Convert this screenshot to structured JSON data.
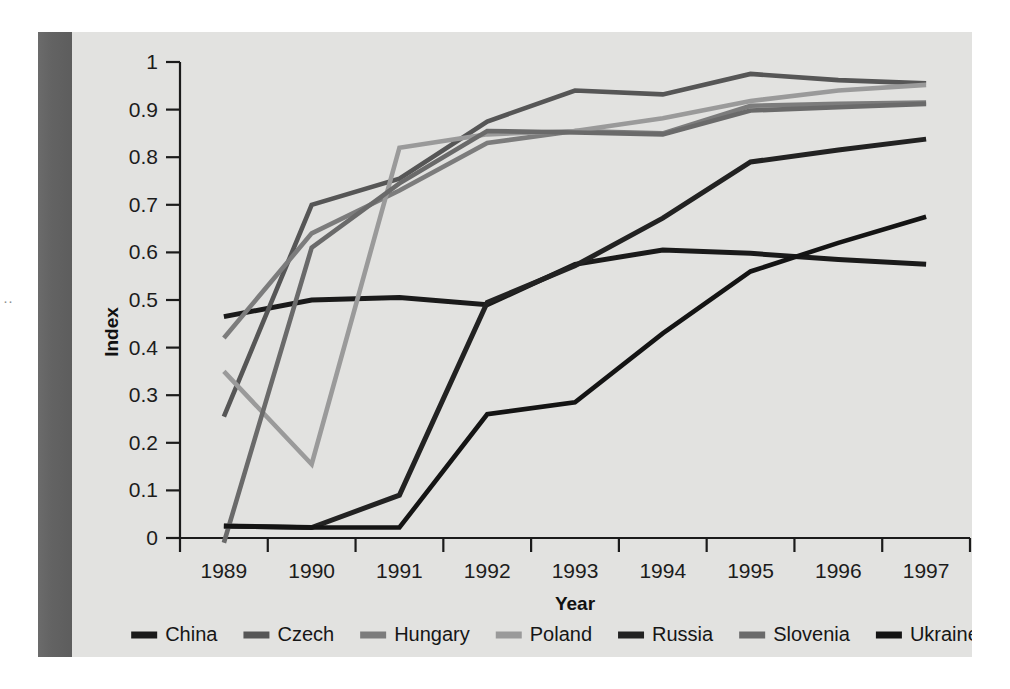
{
  "page": {
    "background_color": "#e2e2e0",
    "gutter_color": "#636363",
    "margin_mark": "··"
  },
  "chart_data": {
    "type": "line",
    "title": "",
    "xlabel": "Year",
    "ylabel": "Index",
    "categories": [
      "1989",
      "1990",
      "1991",
      "1992",
      "1993",
      "1994",
      "1995",
      "1996",
      "1997"
    ],
    "x": [
      1989,
      1990,
      1991,
      1992,
      1993,
      1994,
      1995,
      1996,
      1997
    ],
    "xlim": [
      1989,
      1997
    ],
    "ylim": [
      0,
      1
    ],
    "yticks": [
      "0",
      "0.1",
      "0.2",
      "0.3",
      "0.4",
      "0.5",
      "0.6",
      "0.7",
      "0.8",
      "0.9",
      "1"
    ],
    "ytick_values": [
      0,
      0.1,
      0.2,
      0.3,
      0.4,
      0.5,
      0.6,
      0.7,
      0.8,
      0.9,
      1
    ],
    "grid": false,
    "legend_position": "bottom",
    "series": [
      {
        "name": "China",
        "color": "#1a1a1a",
        "width": 5.0,
        "values": [
          0.465,
          0.5,
          0.505,
          0.49,
          0.575,
          0.605,
          0.598,
          0.585,
          0.575
        ]
      },
      {
        "name": "Czech",
        "color": "#565656",
        "width": 4.6,
        "values": [
          0.255,
          0.7,
          0.755,
          0.875,
          0.94,
          0.932,
          0.975,
          0.962,
          0.955
        ]
      },
      {
        "name": "Hungary",
        "color": "#7c7c7c",
        "width": 4.6,
        "values": [
          0.42,
          0.64,
          0.73,
          0.83,
          0.855,
          0.85,
          0.908,
          0.912,
          0.915
        ]
      },
      {
        "name": "Poland",
        "color": "#9a9a9a",
        "width": 4.6,
        "values": [
          0.35,
          0.155,
          0.82,
          0.848,
          0.855,
          0.882,
          0.918,
          0.94,
          0.952
        ]
      },
      {
        "name": "Russia",
        "color": "#222222",
        "width": 5.0,
        "values": [
          0.025,
          0.022,
          0.09,
          0.495,
          0.572,
          0.672,
          0.79,
          0.815,
          0.838
        ]
      },
      {
        "name": "Slovenia",
        "color": "#6a6a6a",
        "width": 4.6,
        "values": [
          -0.01,
          0.61,
          0.745,
          0.855,
          0.852,
          0.848,
          0.898,
          0.905,
          0.912
        ]
      },
      {
        "name": "Ukraine",
        "color": "#141414",
        "width": 4.6,
        "values": [
          0.025,
          0.022,
          0.022,
          0.26,
          0.285,
          0.43,
          0.56,
          0.62,
          0.675
        ]
      }
    ],
    "legend": [
      {
        "label": "China",
        "color": "#1a1a1a"
      },
      {
        "label": "Czech",
        "color": "#565656"
      },
      {
        "label": "Hungary",
        "color": "#7c7c7c"
      },
      {
        "label": "Poland",
        "color": "#9a9a9a"
      },
      {
        "label": "Russia",
        "color": "#222222"
      },
      {
        "label": "Slovenia",
        "color": "#6a6a6a"
      },
      {
        "label": "Ukraine",
        "color": "#141414"
      }
    ]
  }
}
